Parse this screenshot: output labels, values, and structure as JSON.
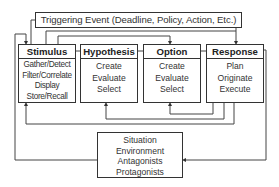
{
  "diagram": {
    "trigger": {
      "label": "Triggering Event (Deadline, Policy, Action, Etc.)"
    },
    "stages": [
      {
        "id": "stimulus",
        "title": "Stimulus",
        "items": [
          "Gather/Detect",
          "Filter/Correlate",
          "Display",
          "Store/Recall"
        ]
      },
      {
        "id": "hypothesis",
        "title": "Hypothesis",
        "items": [
          "Create",
          "Evaluate",
          "Select"
        ]
      },
      {
        "id": "option",
        "title": "Option",
        "items": [
          "Create",
          "Evaluate",
          "Select"
        ]
      },
      {
        "id": "response",
        "title": "Response",
        "items": [
          "Plan",
          "Originate",
          "Execute"
        ]
      }
    ],
    "situation": {
      "items": [
        "Situation",
        "Environment",
        "Antagonists",
        "Protagonists"
      ]
    },
    "colors": {
      "line": "#333333",
      "background": "#ffffff",
      "text": "#2a2a2a"
    }
  }
}
